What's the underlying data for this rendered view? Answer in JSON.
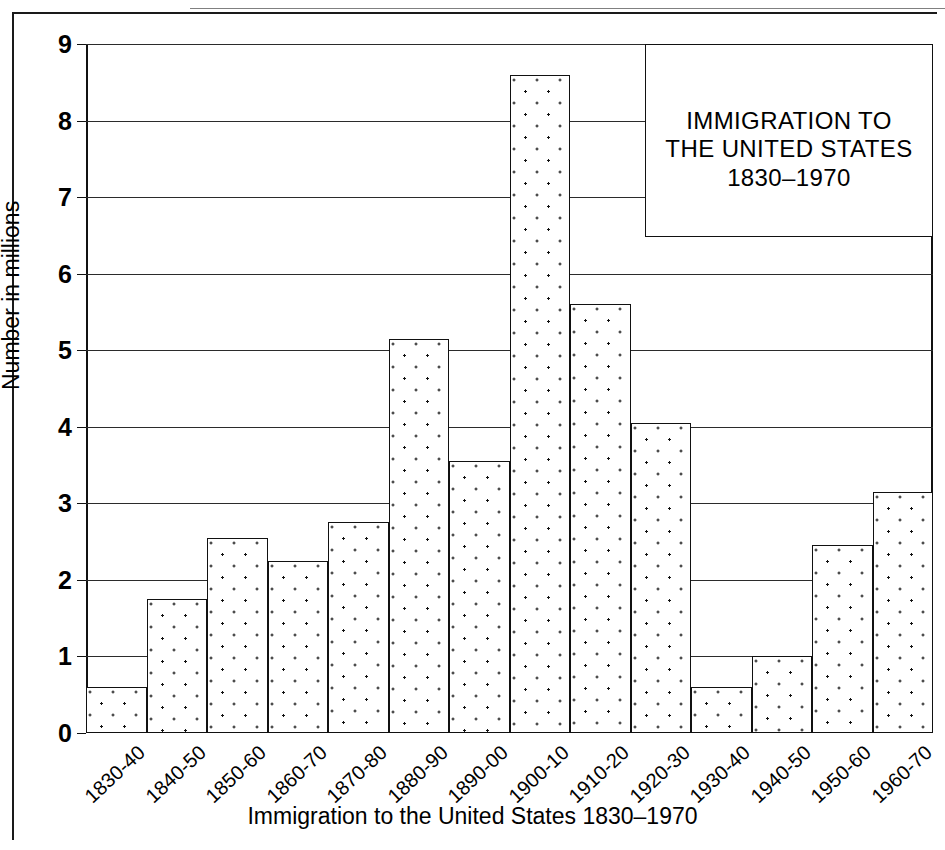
{
  "chart_data": {
    "type": "bar",
    "title": "IMMIGRATION TO THE UNITED STATES 1830–1970",
    "title_lines": [
      "IMMIGRATION TO",
      "THE UNITED STATES",
      "1830–1970"
    ],
    "xlabel": "Immigration to the United States 1830–1970",
    "ylabel": "Number in millions",
    "categories": [
      "1830-40",
      "1840-50",
      "1850-60",
      "1860-70",
      "1870-80",
      "1880-90",
      "1890-00",
      "1900-10",
      "1910-20",
      "1920-30",
      "1930-40",
      "1940-50",
      "1950-60",
      "1960-70"
    ],
    "values": [
      0.6,
      1.75,
      2.55,
      2.25,
      2.75,
      5.15,
      3.55,
      8.6,
      5.6,
      4.05,
      0.6,
      1.0,
      2.45,
      3.15
    ],
    "ylim": [
      0,
      9
    ],
    "yticks": [
      0,
      1,
      2,
      3,
      4,
      5,
      6,
      7,
      8,
      9
    ],
    "ytick_labels": [
      "0",
      "1",
      "2",
      "3",
      "4",
      "5",
      "6",
      "7",
      "8",
      "9"
    ],
    "grid": true,
    "grid_axis": "y",
    "legend_position": "top-right",
    "bar_fill": "stippled-dots",
    "bar_edge_color": "#111111",
    "bar_face_color": "#ffffff",
    "gridline_color": "#2b2b2b"
  }
}
